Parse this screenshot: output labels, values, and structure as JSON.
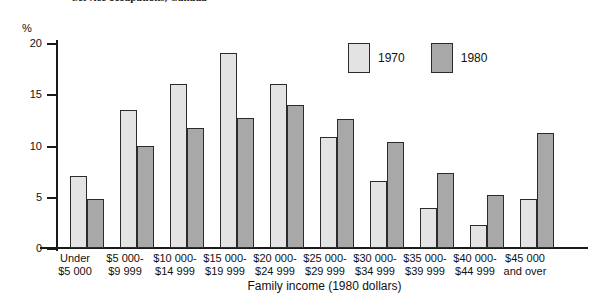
{
  "title_partial": "Service occupations, Canada",
  "axis": {
    "y_unit": "%",
    "y_ticks": [
      "0",
      "5",
      "10",
      "15",
      "20"
    ],
    "x_title": "Family income (1980 dollars)"
  },
  "legend": {
    "items": [
      {
        "label": "1970",
        "color": "#e3e3e3"
      },
      {
        "label": "1980",
        "color": "#a8a8a8"
      }
    ]
  },
  "chart_data": {
    "type": "bar",
    "title": "Service occupations, Canada",
    "xlabel": "Family income (1980 dollars)",
    "ylabel": "%",
    "ylim": [
      0,
      20
    ],
    "yticks": [
      0,
      5,
      10,
      15,
      20
    ],
    "grid": false,
    "legend_position": "top-right",
    "categories": [
      "Under $5 000",
      "$5 000-$9 999",
      "$10 000-$14 999",
      "$15 000-$19 999",
      "$20 000-$24 999",
      "$25 000-$29 999",
      "$30 000-$34 999",
      "$35 000-$39 999",
      "$40 000-$44 999",
      "$45 000 and over"
    ],
    "category_lines": [
      [
        "Under",
        "$5 000"
      ],
      [
        "$5 000-",
        "$9 999"
      ],
      [
        "$10 000-",
        "$14 999"
      ],
      [
        "$15 000-",
        "$19 999"
      ],
      [
        "$20 000-",
        "$24 999"
      ],
      [
        "$25 000-",
        "$29 999"
      ],
      [
        "$30 000-",
        "$34 999"
      ],
      [
        "$35 000-",
        "$39 999"
      ],
      [
        "$40 000-",
        "$44 999"
      ],
      [
        "$45 000",
        "and over"
      ]
    ],
    "series": [
      {
        "name": "1970",
        "color": "#e3e3e3",
        "values": [
          7.0,
          13.5,
          16.0,
          19.0,
          16.0,
          10.8,
          6.5,
          3.9,
          2.2,
          4.8
        ]
      },
      {
        "name": "1980",
        "color": "#a8a8a8",
        "values": [
          4.8,
          10.0,
          11.7,
          12.7,
          14.0,
          12.6,
          10.3,
          7.3,
          5.2,
          11.2
        ]
      }
    ]
  }
}
